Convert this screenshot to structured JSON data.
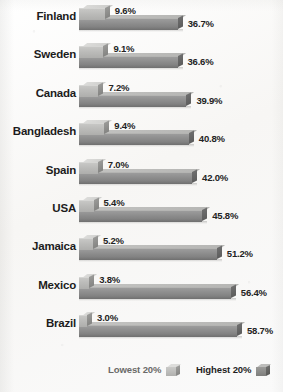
{
  "chart_data": {
    "type": "bar",
    "orientation": "horizontal",
    "title": "",
    "xlabel": "",
    "ylabel": "",
    "categories": [
      "Finland",
      "Sweden",
      "Canada",
      "Bangladesh",
      "Spain",
      "USA",
      "Jamaica",
      "Mexico",
      "Brazil"
    ],
    "series": [
      {
        "name": "Lowest 20%",
        "values": [
          9.6,
          9.1,
          7.2,
          9.4,
          7.0,
          5.4,
          5.2,
          3.8,
          3.0
        ],
        "labels": [
          "9.6%",
          "9.1%",
          "7.2%",
          "9.4%",
          "7.0%",
          "5.4%",
          "5.2%",
          "3.8%",
          "3.0%"
        ]
      },
      {
        "name": "Highest 20%",
        "values": [
          36.7,
          36.6,
          39.9,
          40.8,
          42.0,
          45.8,
          51.2,
          56.4,
          58.7
        ],
        "labels": [
          "36.7%",
          "36.6%",
          "39.9%",
          "40.8%",
          "42.0%",
          "45.8%",
          "51.2%",
          "56.4%",
          "58.7%"
        ]
      }
    ],
    "xlim": [
      0,
      58.7
    ],
    "grid": false,
    "legend_position": "bottom"
  },
  "legend": {
    "low_label": "Lowest 20%",
    "high_label": "Highest 20%"
  },
  "colors": {
    "bar_low": "#bcbcba",
    "bar_high": "#8e8e8e",
    "label_text": "#1c1c1c",
    "background": "#fbfbfa"
  }
}
